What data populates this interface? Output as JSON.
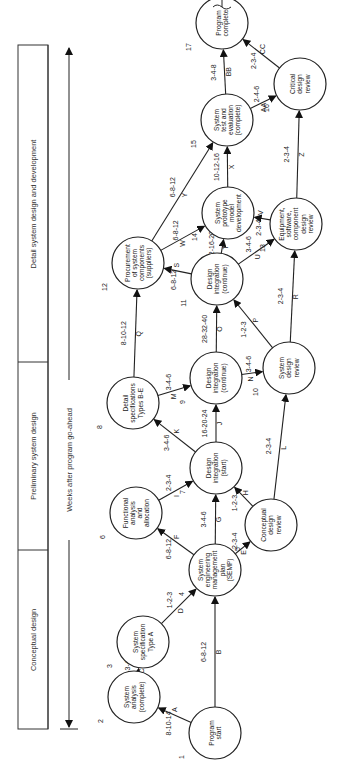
{
  "phases": [
    {
      "label": "Conceptual design"
    },
    {
      "label": "Preliminary system design"
    },
    {
      "label": "Detail system design and development"
    }
  ],
  "axis": {
    "label": "Weeks after program go-ahead"
  },
  "nodes": [
    {
      "id": "1",
      "lines": [
        "Program",
        "start"
      ],
      "x": 215,
      "y": 733
    },
    {
      "id": "2",
      "lines": [
        "System",
        "analysis",
        "(complete)"
      ],
      "x": 134,
      "y": 697
    },
    {
      "id": "3",
      "lines": [
        "System",
        "specification",
        "Type A"
      ],
      "x": 143,
      "y": 642
    },
    {
      "id": "4",
      "lines": [
        "System",
        "engineering",
        "management",
        "plan",
        "(SEMP)"
      ],
      "x": 215,
      "y": 570
    },
    {
      "id": "5",
      "lines": [
        "Conceptual",
        "design",
        "review"
      ],
      "x": 271,
      "y": 525
    },
    {
      "id": "6",
      "lines": [
        "Functional",
        "analysis",
        "and",
        "allocation"
      ],
      "x": 136,
      "y": 513
    },
    {
      "id": "7",
      "lines": [
        "Design",
        "integration",
        "(start)"
      ],
      "x": 216,
      "y": 468
    },
    {
      "id": "8",
      "lines": [
        "Detail",
        "specifications",
        "Types B-E"
      ],
      "x": 133,
      "y": 403
    },
    {
      "id": "9",
      "lines": [
        "Design",
        "integration",
        "(continue)"
      ],
      "x": 216,
      "y": 378
    },
    {
      "id": "10",
      "lines": [
        "System",
        "design",
        "review"
      ],
      "x": 289,
      "y": 368
    },
    {
      "id": "11",
      "lines": [
        "Design",
        "integration",
        "(continue)"
      ],
      "x": 217,
      "y": 279
    },
    {
      "id": "12",
      "lines": [
        "Procurement",
        "of system",
        "components",
        "(suppliers)"
      ],
      "x": 138,
      "y": 263
    },
    {
      "id": "13",
      "lines": [
        "Equipment,",
        "software,",
        "component",
        "design",
        "review"
      ],
      "x": 296,
      "y": 224
    },
    {
      "id": "14",
      "lines": [
        "System",
        "prototype",
        "model",
        "development"
      ],
      "x": 228,
      "y": 213
    },
    {
      "id": "15",
      "lines": [
        "System",
        "test and",
        "evaluation",
        "(complete)"
      ],
      "x": 227,
      "y": 120
    },
    {
      "id": "16",
      "lines": [
        "Critical",
        "design",
        "review"
      ],
      "x": 300,
      "y": 84
    },
    {
      "id": "17",
      "lines": [
        "Program",
        "complete"
      ],
      "x": 222,
      "y": 23
    }
  ],
  "edges": [
    {
      "id": "A",
      "from": "1",
      "to": "2",
      "time": "8-10-14"
    },
    {
      "id": "B",
      "from": "1",
      "to": "4",
      "time": "6-8-12"
    },
    {
      "id": "C",
      "from": "2",
      "to": "3",
      "time": "2-3-4"
    },
    {
      "id": "D",
      "from": "3",
      "to": "4",
      "time": "1-2-3"
    },
    {
      "id": "E",
      "from": "4",
      "to": "5",
      "time": "2-3-4"
    },
    {
      "id": "F",
      "from": "4",
      "to": "6",
      "time": "6-8-12"
    },
    {
      "id": "G",
      "from": "4",
      "to": "7",
      "time": "3-4-6"
    },
    {
      "id": "H",
      "from": "5",
      "to": "7",
      "time": "1-2-3"
    },
    {
      "id": "I",
      "from": "6",
      "to": "7",
      "time": "2-3-4"
    },
    {
      "id": "J",
      "from": "7",
      "to": "9",
      "time": "16-20-24"
    },
    {
      "id": "K",
      "from": "7",
      "to": "8",
      "time": "3-4-6"
    },
    {
      "id": "L",
      "from": "5",
      "to": "10",
      "time": "2-3-4"
    },
    {
      "id": "M",
      "from": "8",
      "to": "9",
      "time": "3-4-6"
    },
    {
      "id": "N",
      "from": "9",
      "to": "10",
      "time": "3-4-6"
    },
    {
      "id": "O",
      "from": "9",
      "to": "11",
      "time": "28-32-40"
    },
    {
      "id": "P",
      "from": "10",
      "to": "11",
      "time": "1-2-3"
    },
    {
      "id": "Q",
      "from": "8",
      "to": "12",
      "time": "8-10-12"
    },
    {
      "id": "R",
      "from": "10",
      "to": "13",
      "time": "2-3-4"
    },
    {
      "id": "S",
      "from": "11",
      "to": "12",
      "time": "6-8-12"
    },
    {
      "id": "T",
      "from": "11",
      "to": "14",
      "time": "12-16-20"
    },
    {
      "id": "U",
      "from": "11",
      "to": "13",
      "time": "3-4-6"
    },
    {
      "id": "V",
      "from": "13",
      "to": "14",
      "time": "2-3-4"
    },
    {
      "id": "W",
      "from": "12",
      "to": "14",
      "time": "6-8-12"
    },
    {
      "id": "X",
      "from": "14",
      "to": "15",
      "time": "10-12-16"
    },
    {
      "id": "Y",
      "from": "12",
      "to": "15",
      "time": "6-8-12"
    },
    {
      "id": "Z",
      "from": "13",
      "to": "16",
      "time": "2-3-4"
    },
    {
      "id": "AA",
      "from": "15",
      "to": "16",
      "time": "2-4-6"
    },
    {
      "id": "BB",
      "from": "15",
      "to": "17",
      "time": "3-4-8"
    },
    {
      "id": "CC",
      "from": "16",
      "to": "17",
      "time": "2-3-4"
    }
  ]
}
